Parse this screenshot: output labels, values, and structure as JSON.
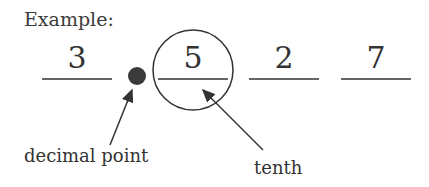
{
  "title": "Example:",
  "digits": [
    "3",
    "5",
    "2",
    "7"
  ],
  "labels": {
    "decimal_point": "decimal point",
    "tenth": "tenth"
  },
  "colors": {
    "ink": "#333333",
    "dot": "#3a3a3a",
    "background": "#ffffff"
  }
}
